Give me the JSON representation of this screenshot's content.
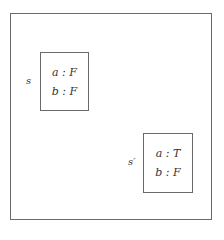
{
  "diagram": {
    "type": "state-space",
    "states": [
      {
        "label": "s",
        "assignments": [
          {
            "variable": "a",
            "value": "F",
            "text": "a : F"
          },
          {
            "variable": "b",
            "value": "F",
            "text": "b : F"
          }
        ]
      },
      {
        "label": "s′",
        "assignments": [
          {
            "variable": "a",
            "value": "T",
            "text": "a : T"
          },
          {
            "variable": "b",
            "value": "F",
            "text": "b : F"
          }
        ]
      }
    ]
  },
  "colors": {
    "border": "#6a6a6a",
    "text": "#333333",
    "background": "#ffffff"
  }
}
